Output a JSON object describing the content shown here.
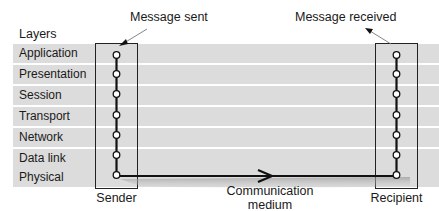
{
  "diagram": {
    "layers_heading": "Layers",
    "layers": [
      {
        "label": "Application"
      },
      {
        "label": "Presentation"
      },
      {
        "label": "Session"
      },
      {
        "label": "Transport"
      },
      {
        "label": "Network"
      },
      {
        "label": "Data link"
      },
      {
        "label": "Physical"
      }
    ],
    "annotations": {
      "message_sent": "Message sent",
      "message_received": "Message received"
    },
    "endpoints": {
      "sender": "Sender",
      "recipient": "Recipient"
    },
    "medium": {
      "line1": "Communication",
      "line2": "medium"
    },
    "colors": {
      "band": "#dcdcdc",
      "line": "#111111",
      "background": "#ffffff"
    }
  }
}
